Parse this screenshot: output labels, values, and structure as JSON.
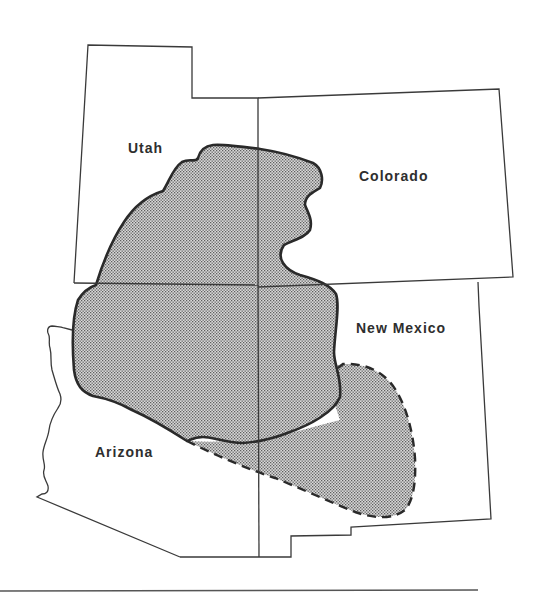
{
  "map": {
    "type": "regional outline map",
    "region": "Four Corners area, southwestern United States",
    "labels": {
      "utah": "Utah",
      "colorado": "Colorado",
      "new_mexico": "New Mexico",
      "arizona": "Arizona"
    },
    "legend_features": {
      "solid_outline_area": "stippled area bounded by solid line",
      "dashed_outline_area": "stippled area bounded by dashed line"
    },
    "colors": {
      "line": "#2a2a2a",
      "fill_dots": "#6a6a6a",
      "background": "#ffffff"
    }
  }
}
